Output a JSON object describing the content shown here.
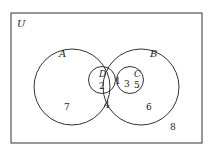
{
  "diagram": {
    "type": "venn",
    "universe_label": "U",
    "sets": [
      {
        "name": "A",
        "label": "A"
      },
      {
        "name": "B",
        "label": "B"
      },
      {
        "name": "D",
        "label": "D"
      },
      {
        "name": "C",
        "label": "C"
      }
    ],
    "regions": {
      "D_only": "2",
      "D_and_C": "1",
      "C_in_A_not_D": "3",
      "C_only_in_B": "5",
      "A_only": "7",
      "A_and_B": "4",
      "B_only": "6",
      "outside": "8"
    },
    "colors": {
      "stroke": "#222222",
      "background": "#ffffff"
    }
  }
}
